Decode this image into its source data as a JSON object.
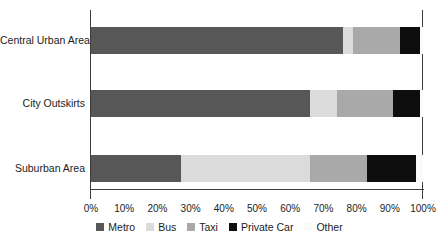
{
  "chart_data": {
    "type": "bar",
    "orientation": "horizontal",
    "stacked": true,
    "title": "",
    "xlabel": "",
    "ylabel": "",
    "grid": false,
    "legend_position": "bottom",
    "xlim": [
      0,
      100
    ],
    "x_ticks": [
      "0%",
      "10%",
      "20%",
      "30%",
      "40%",
      "50%",
      "60%",
      "70%",
      "80%",
      "90%",
      "100%"
    ],
    "categories": [
      "Central Urban Area",
      "City Outskirts",
      "Suburban Area"
    ],
    "series": [
      {
        "name": "Metro",
        "color": "#575757",
        "values": [
          76,
          66,
          27
        ]
      },
      {
        "name": "Bus",
        "color": "#dbdbdb",
        "values": [
          3,
          8,
          39
        ]
      },
      {
        "name": "Taxi",
        "color": "#a9a9a9",
        "values": [
          14,
          17,
          17
        ]
      },
      {
        "name": "Private Car",
        "color": "#0e0e0e",
        "values": [
          6,
          8,
          15
        ]
      },
      {
        "name": "Other",
        "color": "#fafafa",
        "values": [
          1,
          1,
          2
        ]
      }
    ]
  },
  "colors": {
    "axis": "#3d3d3d",
    "text": "#1c1c1c",
    "background": "#ffffff"
  }
}
